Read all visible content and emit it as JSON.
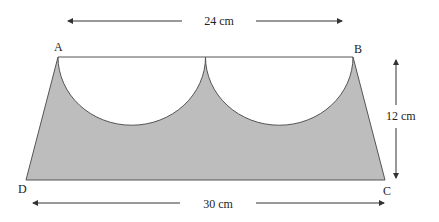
{
  "figure": {
    "vertices": {
      "A": "A",
      "B": "B",
      "C": "C",
      "D": "D"
    },
    "dimensions": {
      "top": "24 cm",
      "bottom": "30 cm",
      "height": "12 cm"
    },
    "colors": {
      "shaded": "#bdbdbd",
      "stroke": "#555555",
      "text": "#222222"
    }
  }
}
